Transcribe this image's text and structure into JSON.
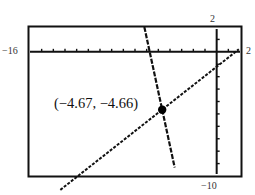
{
  "chart_data": {
    "type": "line",
    "title": "",
    "xlabel": "",
    "ylabel": "",
    "xlim": [
      -16,
      2
    ],
    "ylim": [
      -10,
      2
    ],
    "grid": false,
    "x_tick_step": 1,
    "y_tick_step": 1,
    "window_labels": {
      "xmin": "−16",
      "xmax": "2",
      "ymax": "2",
      "ymin": "−10"
    },
    "series": [
      {
        "name": "line-shallow",
        "style": "dotted",
        "slope": 0.74,
        "intercept": -1.2,
        "x_range": [
          -13.4,
          1.9
        ]
      },
      {
        "name": "line-steep",
        "style": "dashed",
        "slope": -4.35,
        "intercept": -24.97,
        "x_range": [
          -6.2,
          -3.6
        ]
      }
    ],
    "annotations": [
      {
        "type": "point",
        "x": -4.67,
        "y": -4.66,
        "label": "(−4.67, −4.66)"
      }
    ]
  },
  "labels": {
    "xmin": "−16",
    "xmax": "2",
    "ymax": "2",
    "ymin": "−10",
    "intersection": "(−4.67, −4.66)"
  }
}
